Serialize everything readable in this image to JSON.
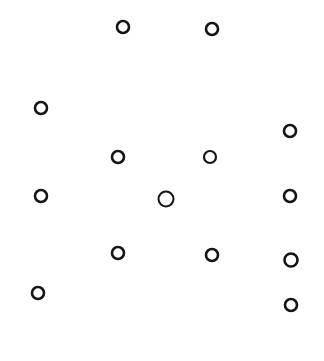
{
  "diagram": {
    "background": "#ffffff",
    "stroke_color": "#141414",
    "circles": [
      {
        "id": "c1",
        "cx": 123,
        "cy": 27,
        "r": 6,
        "stroke_width": 2.6
      },
      {
        "id": "c2",
        "cx": 212,
        "cy": 29,
        "r": 6,
        "stroke_width": 2.6
      },
      {
        "id": "c3",
        "cx": 41,
        "cy": 108,
        "r": 6,
        "stroke_width": 2.6
      },
      {
        "id": "c4",
        "cx": 290,
        "cy": 131,
        "r": 6,
        "stroke_width": 2.6
      },
      {
        "id": "c5",
        "cx": 118,
        "cy": 157,
        "r": 6,
        "stroke_width": 2.6
      },
      {
        "id": "c6",
        "cx": 210,
        "cy": 157,
        "r": 6,
        "stroke_width": 2.2
      },
      {
        "id": "c7",
        "cx": 41,
        "cy": 196,
        "r": 6,
        "stroke_width": 2.6
      },
      {
        "id": "c8",
        "cx": 166,
        "cy": 199,
        "r": 7.5,
        "stroke_width": 2.0
      },
      {
        "id": "c9",
        "cx": 290,
        "cy": 196,
        "r": 6,
        "stroke_width": 2.6
      },
      {
        "id": "c10",
        "cx": 118,
        "cy": 253,
        "r": 6,
        "stroke_width": 2.6
      },
      {
        "id": "c11",
        "cx": 212,
        "cy": 255,
        "r": 6,
        "stroke_width": 2.6
      },
      {
        "id": "c12",
        "cx": 291,
        "cy": 260,
        "r": 6.5,
        "stroke_width": 2.6
      },
      {
        "id": "c13",
        "cx": 38,
        "cy": 293,
        "r": 6,
        "stroke_width": 2.6
      },
      {
        "id": "c14",
        "cx": 291,
        "cy": 305,
        "r": 6,
        "stroke_width": 2.6
      }
    ]
  }
}
